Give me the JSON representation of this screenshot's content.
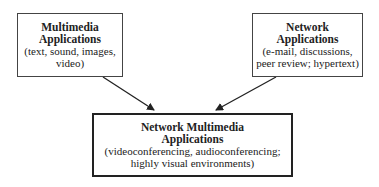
{
  "diagram": {
    "nodes": [
      {
        "id": "multimedia",
        "title_lines": [
          "Multimedia",
          "Applications"
        ],
        "desc_lines": [
          "(text, sound, images,",
          "video)"
        ]
      },
      {
        "id": "network",
        "title_lines": [
          "Network",
          "Applications"
        ],
        "desc_lines": [
          "(e-mail, discussions,",
          "peer review; hypertext)"
        ]
      },
      {
        "id": "network-multimedia",
        "title_lines": [
          "Network Multimedia",
          "Applications"
        ],
        "desc_lines": [
          "(videoconferencing, audioconferencing;",
          "highly visual environments)"
        ]
      }
    ],
    "edges": [
      {
        "from": "multimedia",
        "to": "network-multimedia"
      },
      {
        "from": "network",
        "to": "network-multimedia"
      }
    ]
  }
}
